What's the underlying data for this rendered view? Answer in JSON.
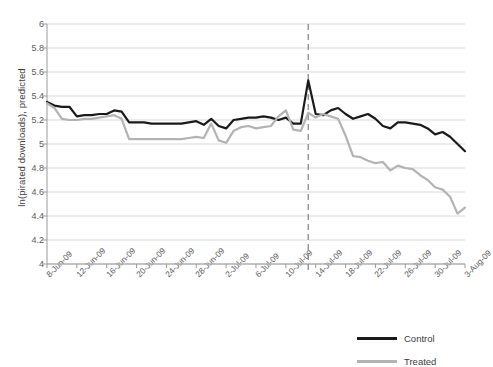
{
  "chart_data": {
    "type": "line",
    "title": "",
    "xlabel": "",
    "ylabel": "ln(pirated downloads), predicted",
    "ylim": [
      4,
      6
    ],
    "ytick_values": [
      4,
      4.2,
      4.4,
      4.6,
      4.8,
      5,
      5.2,
      5.4,
      5.6,
      5.8,
      6
    ],
    "ytick_labels": [
      "4",
      "4.2",
      "4.4",
      "4.6",
      "4.8",
      "5",
      "5.2",
      "5.4",
      "5.6",
      "5.8",
      "6"
    ],
    "grid": true,
    "legend_position": "bottom-right",
    "x": [
      "8-Jun-09",
      "9-Jun-09",
      "10-Jun-09",
      "11-Jun-09",
      "12-Jun-09",
      "13-Jun-09",
      "14-Jun-09",
      "15-Jun-09",
      "16-Jun-09",
      "17-Jun-09",
      "18-Jun-09",
      "19-Jun-09",
      "20-Jun-09",
      "21-Jun-09",
      "22-Jun-09",
      "23-Jun-09",
      "24-Jun-09",
      "25-Jun-09",
      "26-Jun-09",
      "27-Jun-09",
      "28-Jun-09",
      "29-Jun-09",
      "30-Jun-09",
      "1-Jul-09",
      "2-Jul-09",
      "3-Jul-09",
      "4-Jul-09",
      "5-Jul-09",
      "6-Jul-09",
      "7-Jul-09",
      "8-Jul-09",
      "9-Jul-09",
      "10-Jul-09",
      "11-Jul-09",
      "12-Jul-09",
      "13-Jul-09",
      "14-Jul-09",
      "15-Jul-09",
      "16-Jul-09",
      "17-Jul-09",
      "18-Jul-09",
      "19-Jul-09",
      "20-Jul-09",
      "21-Jul-09",
      "22-Jul-09",
      "23-Jul-09",
      "24-Jul-09",
      "25-Jul-09",
      "26-Jul-09",
      "27-Jul-09",
      "28-Jul-09",
      "29-Jul-09",
      "30-Jul-09",
      "31-Jul-09",
      "1-Aug-09",
      "2-Aug-09",
      "3-Aug-09"
    ],
    "xtick_labels": [
      "8-Jun-09",
      "12-Jun-09",
      "16-Jun-09",
      "20-Jun-09",
      "24-Jun-09",
      "28-Jun-09",
      "2-Jul-09",
      "6-Jul-09",
      "10-Jul-09",
      "14-Jul-09",
      "18-Jul-09",
      "22-Jul-09",
      "26-Jul-09",
      "30-Jul-09",
      "3-Aug-09"
    ],
    "xtick_indices": [
      0,
      4,
      8,
      12,
      16,
      20,
      24,
      28,
      32,
      36,
      40,
      44,
      48,
      52,
      56
    ],
    "series": [
      {
        "name": "Control",
        "color": "#1a1a1a",
        "values": [
          5.35,
          5.32,
          5.31,
          5.31,
          5.23,
          5.24,
          5.24,
          5.25,
          5.25,
          5.28,
          5.27,
          5.18,
          5.18,
          5.18,
          5.17,
          5.17,
          5.17,
          5.17,
          5.17,
          5.18,
          5.19,
          5.16,
          5.21,
          5.15,
          5.13,
          5.2,
          5.21,
          5.22,
          5.22,
          5.23,
          5.22,
          5.2,
          5.22,
          5.17,
          5.17,
          5.53,
          5.25,
          5.24,
          5.28,
          5.3,
          5.25,
          5.21,
          5.23,
          5.25,
          5.21,
          5.15,
          5.13,
          5.18,
          5.18,
          5.17,
          5.16,
          5.13,
          5.08,
          5.1,
          5.06,
          5.0,
          4.94
        ]
      },
      {
        "name": "Treated",
        "color": "#b3b3b3",
        "values": [
          5.34,
          5.3,
          5.21,
          5.2,
          5.2,
          5.21,
          5.21,
          5.22,
          5.23,
          5.24,
          5.21,
          5.04,
          5.04,
          5.04,
          5.04,
          5.04,
          5.04,
          5.04,
          5.04,
          5.05,
          5.06,
          5.05,
          5.17,
          5.03,
          5.01,
          5.11,
          5.14,
          5.15,
          5.13,
          5.14,
          5.15,
          5.23,
          5.28,
          5.12,
          5.11,
          5.26,
          5.22,
          5.25,
          5.23,
          5.21,
          5.07,
          4.9,
          4.89,
          4.86,
          4.84,
          4.85,
          4.78,
          4.82,
          4.8,
          4.79,
          4.74,
          4.7,
          4.64,
          4.62,
          4.56,
          4.42,
          4.47
        ]
      }
    ],
    "annotations": [
      {
        "type": "vertical-dashed-line",
        "name": "intervention-line",
        "x_index": 35,
        "x_label": "13-Jul-09",
        "color": "#8c8c8c"
      }
    ]
  },
  "legend": {
    "items": [
      {
        "label": "Control",
        "color": "#1a1a1a"
      },
      {
        "label": "Treated",
        "color": "#b3b3b3"
      }
    ]
  }
}
